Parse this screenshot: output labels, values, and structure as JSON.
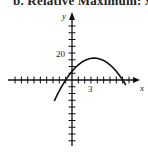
{
  "header": {
    "text": "b. Relative Maximum: x ="
  },
  "chart_data": {
    "type": "line",
    "title": "",
    "xlabel": "x",
    "ylabel": "y",
    "x_tick_label": "3",
    "y_tick_label": "20",
    "x_ticks_per_unit": 1,
    "y_ticks_per_unit": 5,
    "xlim": [
      -10,
      10
    ],
    "ylim": [
      -25,
      25
    ],
    "grid": false,
    "series": [
      {
        "name": "f(x)",
        "function": "-0.8*(x+1)*(x-8)",
        "x": [
          -2.8,
          -1,
          0,
          1,
          2,
          3,
          3.5,
          4,
          5,
          6,
          7,
          8,
          8.5
        ],
        "y": [
          -15.6,
          0,
          6.4,
          11.2,
          14.4,
          16.0,
          16.2,
          16.0,
          14.4,
          11.2,
          6.4,
          0,
          -3.8
        ]
      }
    ],
    "annotations": {
      "relative_maximum": {
        "x": 3.5,
        "y": 16.2
      }
    }
  }
}
